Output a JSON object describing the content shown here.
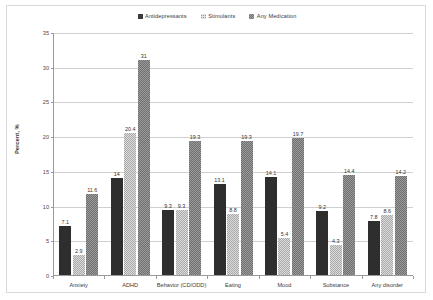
{
  "chart_data": {
    "type": "bar",
    "title": "",
    "xlabel": "",
    "ylabel": "Percent, %",
    "ylim": [
      0,
      35
    ],
    "ytick_values": [
      0,
      5,
      10,
      15,
      20,
      25,
      30,
      35
    ],
    "ytick_labels": [
      "0",
      "5",
      "10",
      "15",
      "20",
      "25",
      "30",
      "35"
    ],
    "grid": "horizontal",
    "legend_position": "top-center",
    "categories": [
      "Anxiety",
      "ADHD",
      "Behavior (CD/ODD)",
      "Eating",
      "Mood",
      "Substance",
      "Any disorder"
    ],
    "series": [
      {
        "name": "Antidepressants",
        "color": "#2e2e2e",
        "values": [
          7.1,
          14,
          9.3,
          13.1,
          14.1,
          9.2,
          7.8
        ],
        "labels": [
          "7.1",
          "14",
          "9.3",
          "13.1",
          "14.1",
          "9.2",
          "7.8"
        ]
      },
      {
        "name": "Stimulants",
        "color": "#dddddd",
        "values": [
          2.9,
          20.4,
          9.3,
          8.8,
          5.4,
          4.3,
          8.6
        ],
        "labels": [
          "2.9",
          "20.4",
          "9.3",
          "8.8",
          "5.4",
          "4.3",
          "8.6"
        ]
      },
      {
        "name": "Any Medication",
        "color": "#9b9b9b",
        "values": [
          11.6,
          31,
          19.3,
          19.3,
          19.7,
          14.4,
          14.2
        ],
        "labels": [
          "11.6",
          "31",
          "19.3",
          "19.3",
          "19.7",
          "14.4",
          "14.2"
        ]
      }
    ]
  }
}
